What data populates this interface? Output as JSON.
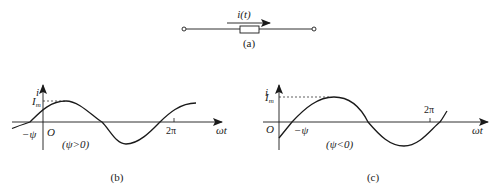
{
  "figure_a": {
    "current_label": "i(t)",
    "caption": "(a)"
  },
  "figure_b": {
    "y_axis_label": "i",
    "x_axis_label": "ωt",
    "origin_label": "O",
    "amplitude_label": "I",
    "amplitude_sub": "m",
    "phase_label": "−ψ",
    "period_label": "2π",
    "condition_label": "(ψ>0)",
    "caption": "(b)"
  },
  "figure_c": {
    "y_axis_label": "i",
    "x_axis_label": "ωt",
    "origin_label": "O",
    "amplitude_label": "I",
    "amplitude_sub": "m",
    "phase_label": "−ψ",
    "period_label": "2π",
    "condition_label": "(ψ<0)",
    "caption": "(c)"
  },
  "colors": {
    "stroke": "#1a1a1a",
    "background": "#ffffff"
  }
}
